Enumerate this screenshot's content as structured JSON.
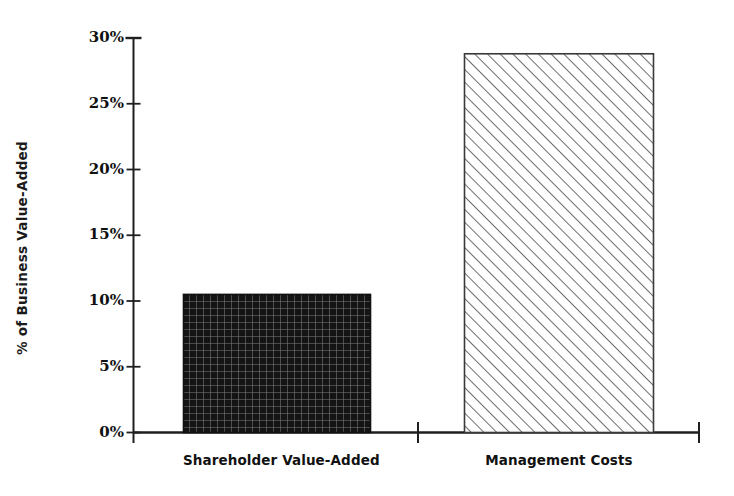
{
  "chart_data": {
    "type": "bar",
    "title": "",
    "subtitle": "",
    "xlabel": "",
    "ylabel": "% of Business Value-Added",
    "categories": [
      "Shareholder Value-Added",
      "Management Costs"
    ],
    "values": [
      10.5,
      28.8
    ],
    "value_labels": [
      "10.5%",
      "28.8%"
    ],
    "ylim": [
      0,
      30
    ],
    "y_ticks": [
      0,
      5,
      10,
      15,
      20,
      25,
      30
    ],
    "y_tick_labels": [
      "0%",
      "5%",
      "10%",
      "15%",
      "20%",
      "25%",
      "30%"
    ],
    "grid": false,
    "legend": false,
    "legend_position": "none",
    "series": [
      {
        "name": "% of Business Value-Added",
        "values": [
          10.5,
          28.8
        ],
        "fills": [
          "dense-crosshatch",
          "diagonal-hatch"
        ],
        "fill_colors": [
          "#1b1b1b",
          "#ffffff"
        ],
        "edge_colors": [
          "#111111",
          "#3a3a3a"
        ]
      }
    ],
    "annotations": []
  },
  "axes": {
    "y_axis_title": "% of Business Value-Added",
    "y_axis_tick_labels": [
      "30%",
      "25%",
      "20%",
      "15%",
      "10%",
      "5%",
      "0%"
    ],
    "x_axis_tick_labels": [
      "Shareholder Value-Added",
      "Management Costs"
    ]
  },
  "style": {
    "background": "#ffffff",
    "axis_color": "#1f1f1f",
    "text_color": "#111111",
    "bar1_color": "#1b1b1b",
    "bar2_color": "#ffffff",
    "hatch_color": "#4a4a4a"
  }
}
